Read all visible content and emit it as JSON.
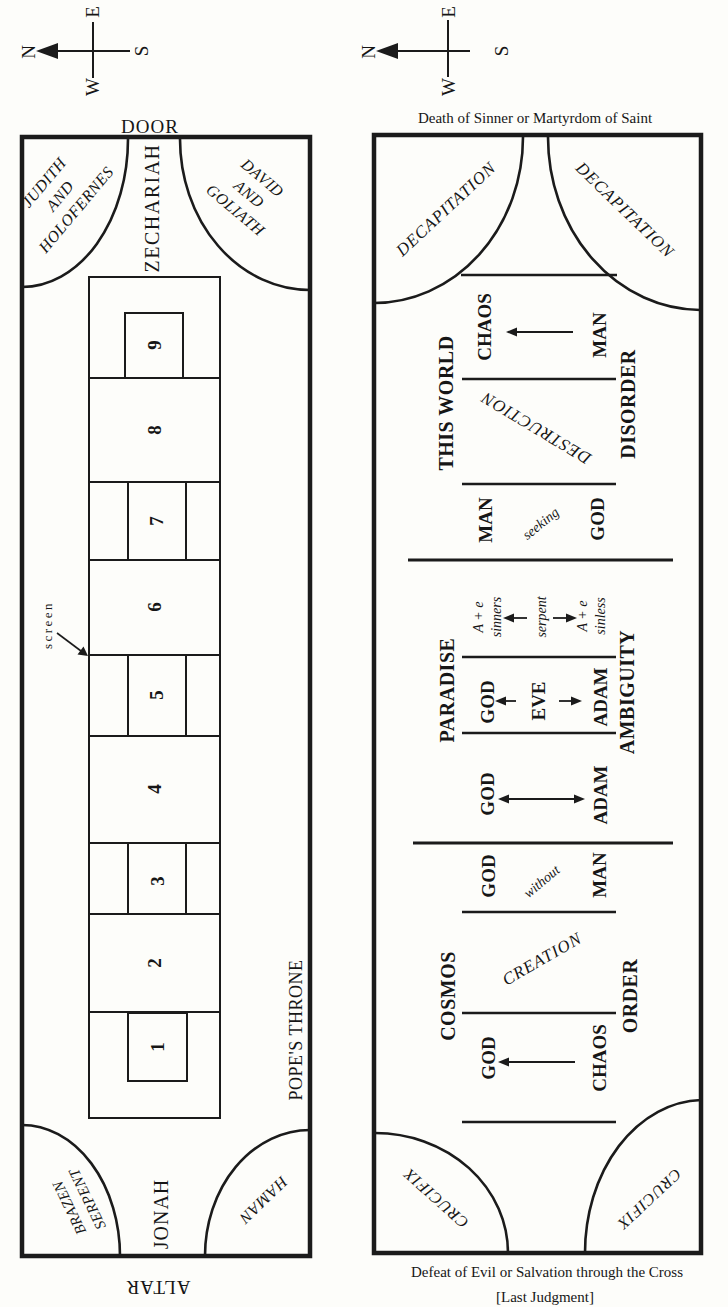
{
  "compass": {
    "north": "N",
    "east": "E",
    "south": "S",
    "west": "W"
  },
  "chapel_plan": {
    "door_label": "DOOR",
    "altar_label": "ALTAR",
    "zechariah": "ZECHARIAH",
    "jonah": "JONAH",
    "popes_throne": "POPE'S THRONE",
    "screen_label": "screen",
    "corner_top_left": [
      "JUDITH",
      "AND",
      "HOLOFERNES"
    ],
    "corner_top_right": [
      "DAVID",
      "AND",
      "GOLIATH"
    ],
    "corner_bottom_left": [
      "BRAZEN",
      "SERPENT"
    ],
    "corner_bottom_right": "HAMAN",
    "panel_numbers": [
      "9",
      "8",
      "7",
      "6",
      "5",
      "4",
      "3",
      "2",
      "1"
    ]
  },
  "schema_plan": {
    "caption_top": "Death of Sinner or Martyrdom of Saint",
    "caption_bottom_line1": "Defeat of Evil or Salvation through the Cross",
    "caption_bottom_line2": "[Last Judgment]",
    "corner_top_left": "DECAPITATION",
    "corner_top_right": "DECAPITATION",
    "corner_bottom_left": "CRUCIFIX",
    "corner_bottom_right": "CRUCIFIX",
    "section_this_world": {
      "label_left": "THIS WORLD",
      "label_right": "DISORDER",
      "chaos": "CHAOS",
      "man_top": "MAN",
      "diagonal": "DESTRUCTION",
      "man_bottom": "MAN",
      "seeking": "seeking",
      "god": "GOD"
    },
    "section_paradise": {
      "label_left": "PARADISE",
      "label_right": "AMBIGUITY",
      "sinners_line1": "A + e",
      "sinners_line2": "sinners",
      "serpent": "serpent",
      "sinless_line1": "A + e",
      "sinless_line2": "sinless",
      "god_eve_row": {
        "god": "GOD",
        "eve": "EVE",
        "adam": "ADAM"
      },
      "god_adam_row": {
        "god": "GOD",
        "adam": "ADAM"
      }
    },
    "section_cosmos": {
      "label_left": "COSMOS",
      "label_right": "ORDER",
      "god_top": "GOD",
      "without": "without",
      "man": "MAN",
      "diagonal": "CREATION",
      "god_bottom": "GOD",
      "chaos": "CHAOS"
    }
  }
}
